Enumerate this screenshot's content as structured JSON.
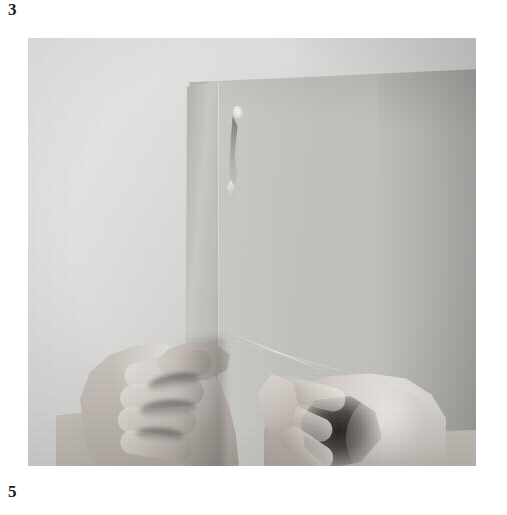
{
  "document": {
    "page_number_top": "3",
    "page_number_bottom": "5",
    "background_color": "#ffffff"
  },
  "photo": {
    "alt_description": "Black and white photograph of two hands holding the lower edge of a large sheet of paper against a plain grey backdrop",
    "type": "grayscale-photograph",
    "frame": {
      "x": 28,
      "y": 38,
      "width": 448,
      "height": 428
    },
    "dominant_colors": {
      "backdrop": "#dcdcda",
      "sheet": "#c0c0bd",
      "skin": "#c6bfb9",
      "deep_shadow": "#1a1817",
      "highlight": "#f6f6f4"
    },
    "elements": [
      {
        "name": "paper-sheet",
        "label": "Sheet of paper"
      },
      {
        "name": "paper-fold-strip",
        "label": "Folded left strip of the sheet"
      },
      {
        "name": "staple-highlight",
        "label": "Bright staple or tear highlight"
      },
      {
        "name": "tear-streak",
        "label": "Dark torn streak below the staple"
      },
      {
        "name": "crease-line",
        "label": "Faint diagonal crease"
      },
      {
        "name": "left-hand",
        "label": "Left hand gripping the paper edge"
      },
      {
        "name": "right-hand",
        "label": "Right hand gripping the paper edge"
      },
      {
        "name": "corner-sheet",
        "label": "Lighter sheet corner at bottom right"
      }
    ]
  }
}
